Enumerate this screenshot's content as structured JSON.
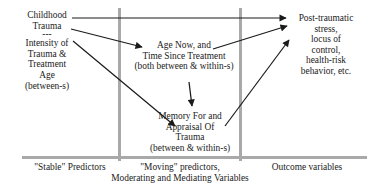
{
  "nodes": {
    "childhood_trauma": {
      "line1": "Childhood",
      "line2": "Trauma",
      "separator": "---",
      "line3": "Intensity of",
      "line4": "Trauma &",
      "line5": "Treatment",
      "line6": "Age",
      "line7": "(between-s)"
    },
    "age_now": {
      "line1": "Age Now, and",
      "line2": "Time Since Treatment",
      "line3": "(both between & within-s)"
    },
    "memory": {
      "line1": "Memory For and",
      "line2": "Appraisal Of",
      "line3": "Trauma",
      "line4": "(between & within-s)"
    },
    "outcome": {
      "line1": "Post-traumatic",
      "line2": "stress,",
      "line3": "locus of",
      "line4": "control,",
      "line5": "health-risk",
      "line6": "behavior, etc."
    }
  },
  "columns": {
    "stable": "\"Stable\" Predictors",
    "moving_line1": "\"Moving\" predictors,",
    "moving_line2": "Moderating and Mediating Variables",
    "outcome": "Outcome variables"
  },
  "colors": {
    "divider": "#a9a9a9",
    "arrow": "#1a1a1a"
  }
}
